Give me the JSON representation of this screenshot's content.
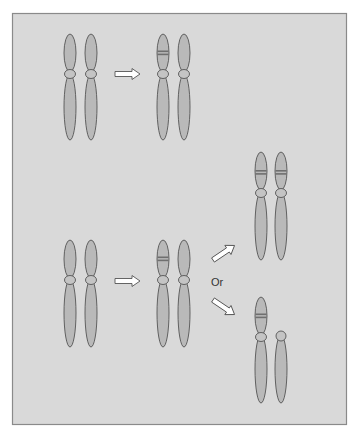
{
  "diagram": {
    "type": "chromosome-duplication-schematic",
    "colors": {
      "background": "#ffffff",
      "panel": "#d9d9d9",
      "panel_border": "#8a8a8a",
      "chromatid": "#b9b9b9",
      "outline": "#555555",
      "band": "#6f6f6f",
      "arrow_fill": "#ffffff"
    },
    "rows": [
      {
        "name": "top-row",
        "stages": [
          {
            "name": "initial-pair",
            "chromosomes": [
              {
                "cx": 70,
                "banded": false
              },
              {
                "cx": 91,
                "banded": false
              }
            ]
          },
          {
            "name": "mutated-pair",
            "chromosomes": [
              {
                "cx": 163,
                "banded": true
              },
              {
                "cx": 184,
                "banded": false
              }
            ]
          }
        ],
        "arrows": [
          {
            "from": [
              115,
              74
            ],
            "to": [
              140,
              74
            ]
          }
        ]
      },
      {
        "name": "bottom-row",
        "stages": [
          {
            "name": "initial-pair",
            "chromosomes": [
              {
                "cx": 70,
                "banded": false
              },
              {
                "cx": 91,
                "banded": false
              }
            ]
          },
          {
            "name": "mutated-pair",
            "chromosomes": [
              {
                "cx": 163,
                "banded": true
              },
              {
                "cx": 184,
                "banded": false
              }
            ]
          },
          {
            "name": "outcome-both-banded",
            "chromosomes": [
              {
                "cx": 261,
                "banded": true
              },
              {
                "cx": 281,
                "banded": true
              }
            ]
          },
          {
            "name": "outcome-loss",
            "chromosomes": [
              {
                "cx": 261,
                "banded": true
              },
              {
                "cx": 281,
                "banded": false,
                "short_arm_missing": true
              }
            ]
          }
        ],
        "arrows": [
          {
            "from": [
              115,
              281
            ],
            "to": [
              140,
              281
            ]
          },
          {
            "from": [
              213,
              259
            ],
            "to": [
              236,
              243
            ]
          },
          {
            "from": [
              213,
              301
            ],
            "to": [
              236,
              317
            ]
          }
        ]
      }
    ],
    "labels": {
      "or": "Or"
    }
  }
}
